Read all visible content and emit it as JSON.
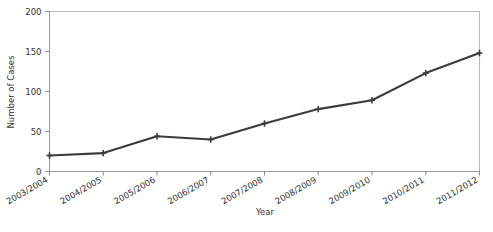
{
  "chart_data": {
    "type": "line",
    "title": "",
    "xlabel": "Year",
    "ylabel": "Number of Cases",
    "categories": [
      "2003/2004",
      "2004/2005",
      "2005/2006",
      "2006/2007",
      "2007/2008",
      "2008/2009",
      "2009/2010",
      "2010/2011",
      "2011/2012"
    ],
    "values": [
      20,
      23,
      44,
      40,
      60,
      78,
      89,
      123,
      148
    ],
    "series": [
      {
        "name": "Number of Cases",
        "values": [
          20,
          23,
          44,
          40,
          60,
          78,
          89,
          123,
          148
        ]
      }
    ],
    "ylim": [
      0,
      200
    ],
    "yticks": [
      0,
      50,
      100,
      150,
      200
    ],
    "ytick_labels": [
      "0",
      "50",
      "100",
      "150",
      "200"
    ],
    "grid": false,
    "legend": false,
    "legend_position": "none",
    "line_color": "#3b3b3b",
    "marker": "plus",
    "marker_color": "#3b3b3b",
    "frame_color": "#b9b9b9",
    "xtick_rotation_degrees": -30
  },
  "axes": {
    "y_title": "Number of Cases",
    "x_title": "Year"
  }
}
